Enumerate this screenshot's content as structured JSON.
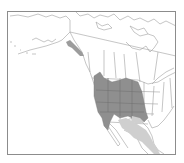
{
  "map": {
    "type": "species-range-map",
    "region": "North America",
    "caption_partial": "",
    "colors": {
      "frame": "#8c8c8c",
      "boundaries": "#9a9a9a",
      "primary_range": "#8f8f8f",
      "secondary_range": "#cfcfcf",
      "alaska_range": "#9c9c9c",
      "background": "#ffffff"
    },
    "legend": {
      "primary_range": "Western US interior (dark gray)",
      "secondary_range": "Northern/central Mexico (light gray)",
      "isolated_range": "Southeast Alaska / coastal BC (gray)"
    }
  }
}
